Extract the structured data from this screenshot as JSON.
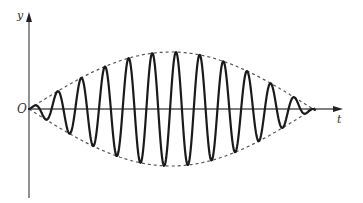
{
  "figure": {
    "labels": {
      "y_axis": "y",
      "t_axis": "t",
      "origin": "O"
    },
    "colors": {
      "axis": "#555555",
      "wave": "#1a1a1a",
      "envelope": "#555555",
      "background": "#ffffff"
    },
    "geometry": {
      "origin_x": 29,
      "axis_y": 109,
      "y_axis_top": 12,
      "y_axis_bottom": 198,
      "t_axis_end": 343,
      "envelope_amplitude": 57,
      "envelope_period_px": 284,
      "carrier_period_px": 23.7,
      "wave_start_x": 29,
      "wave_end_x": 315
    }
  }
}
